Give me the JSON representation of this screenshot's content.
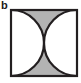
{
  "figure": {
    "panel_label": "b",
    "caption": "",
    "shape_name": "square-with-two-arcs",
    "colors": {
      "shaded_region": "#b3b3b3",
      "unshaded_region": "#ffffff",
      "outline": "#231f20",
      "background": "#ffffff",
      "label_text": "#1a1a1a"
    },
    "geometry": {
      "square_side": 66,
      "square_x": 2,
      "square_y": 2,
      "arc_radius": 33,
      "left_arc_center": [
        2,
        35
      ],
      "right_arc_center": [
        68,
        35
      ],
      "tangent_point": [
        35,
        35
      ],
      "outline_width": 2.2
    },
    "regions": [
      {
        "name": "top-shaded-wedge",
        "fill": "#b3b3b3"
      },
      {
        "name": "bottom-shaded-wedge",
        "fill": "#b3b3b3"
      },
      {
        "name": "left-white-lens",
        "fill": "#ffffff"
      },
      {
        "name": "right-white-lens",
        "fill": "#ffffff"
      }
    ]
  }
}
